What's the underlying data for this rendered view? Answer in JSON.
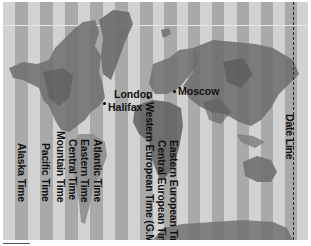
{
  "map": {
    "title": "World Time Zones",
    "colors": {
      "light_stripe": "#d2d2d2",
      "dark_stripe": "#a9a9a9",
      "land_dark": "#6b6b6b",
      "land_mid": "#8a8a8a",
      "label": "#111111"
    },
    "cities": [
      {
        "name": "London",
        "x": 114,
        "y": 86
      },
      {
        "name": "Halifax",
        "x": 106,
        "y": 101
      },
      {
        "name": "Moscow",
        "x": 177,
        "y": 86
      }
    ],
    "timezone_labels": [
      {
        "text": "Alaska Time",
        "x": 26,
        "y": 143
      },
      {
        "text": "Pacific Time",
        "x": 50,
        "y": 143
      },
      {
        "text": "Mountain Time",
        "x": 65,
        "y": 131
      },
      {
        "text": "Central Time",
        "x": 77,
        "y": 139
      },
      {
        "text": "Eastern Time",
        "x": 89,
        "y": 139
      },
      {
        "text": "Atlantic Time",
        "x": 102,
        "y": 139
      },
      {
        "text": "Western European Time (G.M.T.)",
        "x": 155,
        "y": 102
      },
      {
        "text": "Central European Time",
        "x": 167,
        "y": 140
      },
      {
        "text": "Eastern European Time",
        "x": 179,
        "y": 140
      }
    ],
    "date_line_label": "Date Line"
  }
}
